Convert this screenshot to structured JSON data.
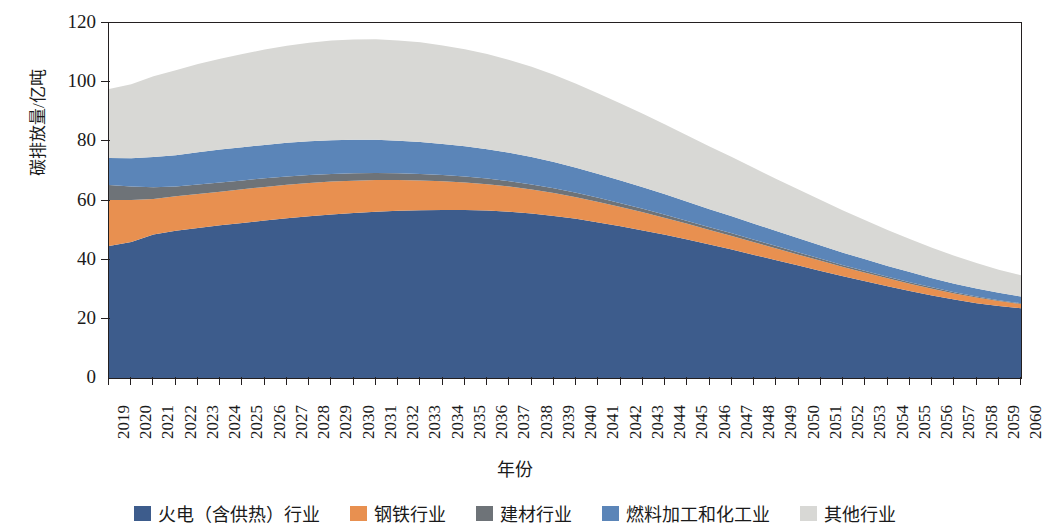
{
  "chart_data": {
    "type": "area",
    "title": "",
    "xlabel": "年份",
    "ylabel": "碳排放量/亿吨",
    "stacked": true,
    "grid": false,
    "legend_position": "bottom",
    "ylim": [
      0,
      120
    ],
    "yticks": [
      0,
      20,
      40,
      60,
      80,
      100,
      120
    ],
    "xlim": [
      2019,
      2060
    ],
    "categories": [
      2019,
      2020,
      2021,
      2022,
      2023,
      2024,
      2025,
      2026,
      2027,
      2028,
      2029,
      2030,
      2031,
      2032,
      2033,
      2034,
      2035,
      2036,
      2037,
      2038,
      2039,
      2040,
      2041,
      2042,
      2043,
      2044,
      2045,
      2046,
      2047,
      2048,
      2049,
      2050,
      2051,
      2052,
      2053,
      2054,
      2055,
      2056,
      2057,
      2058,
      2059,
      2060
    ],
    "series": [
      {
        "name": "火电（含供热）行业",
        "color": "#3d5c8c",
        "values": [
          44.6,
          46.0,
          48.5,
          49.8,
          50.7,
          51.6,
          52.4,
          53.2,
          54.0,
          54.7,
          55.3,
          55.8,
          56.2,
          56.5,
          56.7,
          56.8,
          56.8,
          56.6,
          56.2,
          55.6,
          54.8,
          53.8,
          52.6,
          51.3,
          49.9,
          48.4,
          46.8,
          45.1,
          43.4,
          41.6,
          39.8,
          38.0,
          36.2,
          34.4,
          32.7,
          31.0,
          29.4,
          27.9,
          26.5,
          25.3,
          24.3,
          23.6
        ]
      },
      {
        "name": "钢铁行业",
        "color": "#e89050",
        "values": [
          15.6,
          14.2,
          12.0,
          11.6,
          11.5,
          11.4,
          11.4,
          11.4,
          11.3,
          11.2,
          11.1,
          10.9,
          10.7,
          10.4,
          10.1,
          9.7,
          9.3,
          8.9,
          8.5,
          8.1,
          7.7,
          7.3,
          6.9,
          6.5,
          6.1,
          5.7,
          5.3,
          4.9,
          4.6,
          4.3,
          4.0,
          3.7,
          3.4,
          3.1,
          2.9,
          2.7,
          2.5,
          2.3,
          2.1,
          1.9,
          1.7,
          1.4
        ]
      },
      {
        "name": "建材行业",
        "color": "#6e7378",
        "values": [
          5.0,
          4.5,
          4.0,
          3.3,
          3.2,
          3.1,
          3.0,
          2.9,
          2.8,
          2.7,
          2.6,
          2.5,
          2.4,
          2.3,
          2.2,
          2.1,
          2.0,
          1.9,
          1.8,
          1.7,
          1.6,
          1.5,
          1.4,
          1.3,
          1.2,
          1.1,
          1.0,
          0.95,
          0.9,
          0.85,
          0.8,
          0.75,
          0.7,
          0.65,
          0.6,
          0.55,
          0.5,
          0.45,
          0.4,
          0.35,
          0.3,
          0.25
        ]
      },
      {
        "name": "燃料加工和化工业",
        "color": "#5b85b8",
        "values": [
          9.2,
          9.6,
          10.2,
          10.6,
          10.9,
          11.1,
          11.2,
          11.3,
          11.4,
          11.4,
          11.4,
          11.3,
          11.2,
          11.0,
          10.8,
          10.5,
          10.2,
          9.9,
          9.6,
          9.3,
          8.9,
          8.5,
          8.1,
          7.7,
          7.3,
          6.9,
          6.5,
          6.1,
          5.8,
          5.4,
          5.1,
          4.8,
          4.5,
          4.2,
          3.9,
          3.6,
          3.4,
          3.1,
          2.9,
          2.7,
          2.5,
          2.3
        ]
      },
      {
        "name": "其他行业",
        "color": "#d8d8d5",
        "values": [
          23.3,
          25.0,
          27.3,
          28.7,
          29.8,
          30.7,
          31.5,
          32.2,
          32.8,
          33.3,
          33.7,
          33.9,
          34.0,
          33.9,
          33.7,
          33.3,
          32.8,
          32.2,
          31.4,
          30.5,
          29.5,
          28.4,
          27.2,
          26.0,
          24.8,
          23.6,
          22.4,
          21.2,
          20.0,
          18.8,
          17.6,
          16.5,
          15.4,
          14.3,
          13.2,
          12.2,
          11.2,
          10.3,
          9.4,
          8.6,
          7.8,
          7.2
        ]
      }
    ]
  },
  "axes": {
    "y_title": "碳排放量/亿吨",
    "x_title": "年份",
    "y_tick_labels": [
      "120",
      "100",
      "80",
      "60",
      "40",
      "20",
      "0"
    ]
  },
  "legend": {
    "items": [
      {
        "label": "火电（含供热）行业",
        "color": "#3d5c8c",
        "swatch_name": "legend-swatch-thermal-power"
      },
      {
        "label": "钢铁行业",
        "color": "#e89050",
        "swatch_name": "legend-swatch-steel"
      },
      {
        "label": "建材行业",
        "color": "#6e7378",
        "swatch_name": "legend-swatch-building-materials"
      },
      {
        "label": "燃料加工和化工业",
        "color": "#5b85b8",
        "swatch_name": "legend-swatch-fuel-chemical"
      },
      {
        "label": "其他行业",
        "color": "#d8d8d5",
        "swatch_name": "legend-swatch-other"
      }
    ]
  }
}
